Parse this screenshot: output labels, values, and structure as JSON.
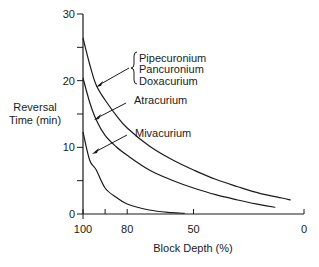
{
  "chart_data": {
    "type": "line",
    "title": "",
    "xlabel": "Block Depth (%)",
    "ylabel": "Reversal Time (min)",
    "ylabel_lines": [
      "Reversal",
      "Time (min)"
    ],
    "xlim": [
      100,
      0
    ],
    "ylim": [
      0,
      30
    ],
    "x_ticks": [
      {
        "value": 100,
        "label": "100"
      },
      {
        "value": 90,
        "label": ""
      },
      {
        "value": 80,
        "label": "80"
      },
      {
        "value": 50,
        "label": "50"
      },
      {
        "value": 0,
        "label": "0"
      }
    ],
    "y_ticks": [
      {
        "value": 0,
        "label": "0"
      },
      {
        "value": 5,
        "label": ""
      },
      {
        "value": 10,
        "label": "10"
      },
      {
        "value": 15,
        "label": ""
      },
      {
        "value": 20,
        "label": "20"
      },
      {
        "value": 25,
        "label": ""
      },
      {
        "value": 30,
        "label": "30"
      }
    ],
    "grid": false,
    "legend": "inline labels with arrows",
    "series": [
      {
        "name": "Pipecuronium / Pancuronium / Doxacurium",
        "labels": [
          "Pipecuronium",
          "Pancuronium",
          "Doxacurium"
        ],
        "points": [
          [
            100,
            26.4
          ],
          [
            97,
            22.5
          ],
          [
            94,
            19.3
          ],
          [
            90,
            17.1
          ],
          [
            85,
            14.8
          ],
          [
            80,
            12.9
          ],
          [
            70,
            10.2
          ],
          [
            60,
            8.2
          ],
          [
            50,
            6.6
          ],
          [
            40,
            5.2
          ],
          [
            30,
            4.1
          ],
          [
            20,
            3.1
          ],
          [
            10,
            2.4
          ],
          [
            6,
            2.1
          ]
        ]
      },
      {
        "name": "Atracurium",
        "labels": [
          "Atracurium"
        ],
        "points": [
          [
            100,
            20.4
          ],
          [
            97,
            16.8
          ],
          [
            94,
            14.1
          ],
          [
            90,
            11.8
          ],
          [
            85,
            10.1
          ],
          [
            80,
            8.8
          ],
          [
            70,
            6.6
          ],
          [
            60,
            5.1
          ],
          [
            50,
            3.9
          ],
          [
            40,
            2.9
          ],
          [
            30,
            2.1
          ],
          [
            20,
            1.4
          ],
          [
            13,
            1.0
          ]
        ]
      },
      {
        "name": "Mivacurium",
        "labels": [
          "Mivacurium"
        ],
        "points": [
          [
            100,
            12.3
          ],
          [
            97,
            8.1
          ],
          [
            94,
            6.6
          ],
          [
            90,
            3.9
          ],
          [
            85,
            2.5
          ],
          [
            80,
            1.5
          ],
          [
            70,
            0.6
          ],
          [
            60,
            0.2
          ],
          [
            54,
            0.1
          ]
        ]
      }
    ],
    "annotations": [
      {
        "text": "Pipecuronium",
        "group": "brace"
      },
      {
        "text": "Pancuronium",
        "group": "brace"
      },
      {
        "text": "Doxacurium",
        "group": "brace"
      },
      {
        "text": "Atracurium",
        "arrow": true
      },
      {
        "text": "Mivacurium",
        "arrow": true
      }
    ],
    "colors": {
      "line": "#1a1a1a",
      "background": "#ffffff"
    }
  }
}
